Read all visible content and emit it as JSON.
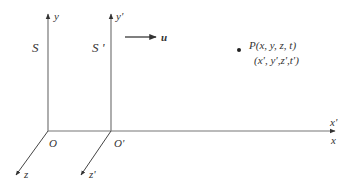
{
  "diagram": {
    "colors": {
      "axis": "#555555",
      "text": "#333333",
      "background": "#ffffff"
    },
    "frame_S": {
      "label": "S",
      "origin_label": "O",
      "x_label": "x",
      "y_label": "y",
      "z_label": "z"
    },
    "frame_S_prime": {
      "label": "S '",
      "origin_label": "O'",
      "x_label": "x'",
      "y_label": "y'",
      "z_label": "z'"
    },
    "velocity": {
      "label": "u"
    },
    "point": {
      "coords_S": "P(x, y, z, t)",
      "coords_S_prime": "(x', y',z',t')"
    }
  }
}
